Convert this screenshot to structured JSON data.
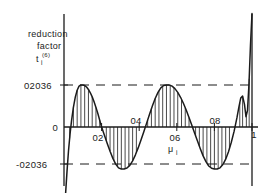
{
  "figure": {
    "axis_labels": {
      "y_line1": "reduction",
      "y_line2": "factor",
      "y_symbol": "t",
      "y_symbol_sub": "i",
      "y_symbol_sup": "(6)",
      "x_symbol": "μ",
      "x_symbol_sub": "i"
    },
    "y_ticks": {
      "positive": "02036",
      "zero": "0",
      "negative": "-02036"
    },
    "x_ticks": [
      "02",
      "04",
      "06",
      "08",
      "1"
    ],
    "colors": {
      "curve": "#1b1b1b",
      "axis": "#1b1b1b",
      "dashed": "#1b1b1b",
      "hatch": "#1b1b1b",
      "background": "#ffffff"
    }
  },
  "chart_data": {
    "type": "line",
    "title": "",
    "subtitle": "",
    "xlabel": "μ i",
    "ylabel": "reduction factor t i (6)",
    "xlim": [
      0,
      1
    ],
    "ylim": [
      -0.45,
      0.55
    ],
    "grid": false,
    "legend": null,
    "xticks": [
      0.2,
      0.4,
      0.6,
      0.8,
      1.0
    ],
    "xticklabels": [
      "02",
      "04",
      "06",
      "08",
      "1"
    ],
    "yticks": [
      -0.2036,
      0,
      0.2036
    ],
    "yticklabels": [
      "-02036",
      "0",
      "02036"
    ],
    "envelope_lines": [
      {
        "value": 0.2036,
        "style": "dashed",
        "label": "02036"
      },
      {
        "value": -0.2036,
        "style": "dashed",
        "label": "-02036"
      }
    ],
    "fill_style": "vertical-hatch-to-zero-axis",
    "series": [
      {
        "name": "reduction factor",
        "x": [
          0.0,
          0.008,
          0.016,
          0.024,
          0.032,
          0.04,
          0.05,
          0.06,
          0.07,
          0.08,
          0.09,
          0.1,
          0.11,
          0.12,
          0.13,
          0.14,
          0.15,
          0.16,
          0.17,
          0.18,
          0.19,
          0.2,
          0.215,
          0.23,
          0.245,
          0.26,
          0.275,
          0.29,
          0.305,
          0.32,
          0.335,
          0.35,
          0.365,
          0.38,
          0.395,
          0.41,
          0.425,
          0.44,
          0.455,
          0.47,
          0.485,
          0.5,
          0.515,
          0.53,
          0.545,
          0.56,
          0.575,
          0.59,
          0.605,
          0.62,
          0.635,
          0.65,
          0.665,
          0.68,
          0.695,
          0.71,
          0.725,
          0.74,
          0.755,
          0.77,
          0.785,
          0.8,
          0.815,
          0.83,
          0.845,
          0.86,
          0.875,
          0.89,
          0.905,
          0.92,
          0.93,
          0.94,
          0.95,
          0.96,
          0.968,
          0.976,
          0.984,
          0.992,
          1.0
        ],
        "y": [
          -0.45,
          -0.33,
          -0.215,
          -0.115,
          -0.035,
          0.03,
          0.095,
          0.145,
          0.178,
          0.198,
          0.2036,
          0.2036,
          0.201,
          0.194,
          0.182,
          0.166,
          0.146,
          0.122,
          0.095,
          0.065,
          0.033,
          0.0,
          -0.04,
          -0.08,
          -0.118,
          -0.152,
          -0.18,
          -0.198,
          -0.2036,
          -0.2036,
          -0.199,
          -0.186,
          -0.164,
          -0.135,
          -0.1,
          -0.062,
          -0.022,
          0.02,
          0.062,
          0.102,
          0.138,
          0.168,
          0.19,
          0.201,
          0.2036,
          0.2036,
          0.198,
          0.186,
          0.168,
          0.144,
          0.115,
          0.082,
          0.046,
          0.008,
          -0.03,
          -0.068,
          -0.105,
          -0.14,
          -0.168,
          -0.189,
          -0.2,
          -0.2036,
          -0.2036,
          -0.198,
          -0.182,
          -0.156,
          -0.12,
          -0.074,
          -0.02,
          0.045,
          0.095,
          0.14,
          0.15,
          0.11,
          0.05,
          0.08,
          0.21,
          0.4,
          0.55
        ]
      }
    ],
    "hatch_x_positions": [
      0.03,
      0.05,
      0.07,
      0.09,
      0.11,
      0.13,
      0.15,
      0.17,
      0.19,
      0.225,
      0.245,
      0.265,
      0.285,
      0.305,
      0.325,
      0.345,
      0.365,
      0.385,
      0.445,
      0.465,
      0.485,
      0.505,
      0.525,
      0.545,
      0.565,
      0.585,
      0.605,
      0.625,
      0.645,
      0.665,
      0.7,
      0.72,
      0.74,
      0.76,
      0.78,
      0.8,
      0.82,
      0.84,
      0.86,
      0.88,
      0.935,
      0.95,
      0.97,
      0.985
    ]
  }
}
